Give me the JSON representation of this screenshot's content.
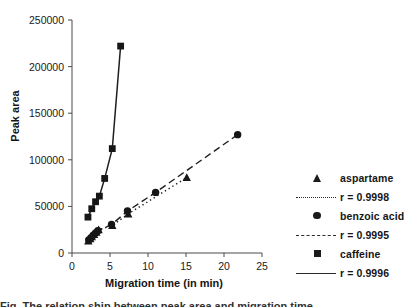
{
  "figure": {
    "caption_partial": "Fig. The relation ship between peak area and migration time",
    "background": "#ffffff",
    "ink": "#1b1b1b"
  },
  "axes": {
    "ylabel": "Peak area",
    "xlabel": "Migration time (in min)",
    "xticks": [
      "0",
      "5",
      "10",
      "15",
      "20",
      "25"
    ],
    "yticks": [
      "0",
      "50000",
      "100000",
      "150000",
      "200000",
      "250000"
    ]
  },
  "legend": {
    "rows": [
      {
        "kind": "series",
        "marker": "triangle-marker",
        "label": "aspartame"
      },
      {
        "kind": "fit",
        "marker": "dotted-line-key",
        "label": "r = 0.9998"
      },
      {
        "kind": "series",
        "marker": "circle-marker",
        "label": "benzoic acid"
      },
      {
        "kind": "fit",
        "marker": "dashed-line-key",
        "label": "r = 0.9995"
      },
      {
        "kind": "series",
        "marker": "square-marker",
        "label": "caffeine"
      },
      {
        "kind": "fit",
        "marker": "solid-line-key",
        "label": "r = 0.9996"
      }
    ]
  },
  "chart_data": {
    "type": "scatter",
    "title": "",
    "xlabel": "Migration time (in min)",
    "ylabel": "Peak area",
    "xlim": [
      0,
      25
    ],
    "ylim": [
      0,
      250000
    ],
    "grid": false,
    "legend_position": "right",
    "series": [
      {
        "name": "aspartame",
        "marker": "triangle",
        "fit_line": "dotted",
        "r": "0.9998",
        "points": [
          {
            "x": 2.15,
            "y": 13000
          },
          {
            "x": 2.4,
            "y": 15500
          },
          {
            "x": 2.6,
            "y": 17500
          },
          {
            "x": 2.9,
            "y": 20000
          },
          {
            "x": 3.2,
            "y": 22500
          },
          {
            "x": 3.5,
            "y": 25000
          },
          {
            "x": 5.3,
            "y": 29500
          },
          {
            "x": 7.4,
            "y": 42000
          },
          {
            "x": 15.1,
            "y": 81000
          }
        ]
      },
      {
        "name": "benzoic acid",
        "marker": "circle",
        "fit_line": "dashed",
        "r": "0.9995",
        "points": [
          {
            "x": 2.2,
            "y": 14000
          },
          {
            "x": 2.5,
            "y": 16500
          },
          {
            "x": 2.8,
            "y": 19000
          },
          {
            "x": 3.1,
            "y": 21500
          },
          {
            "x": 3.4,
            "y": 24000
          },
          {
            "x": 5.2,
            "y": 30500
          },
          {
            "x": 7.3,
            "y": 45000
          },
          {
            "x": 11.0,
            "y": 65000
          },
          {
            "x": 21.8,
            "y": 127000
          }
        ]
      },
      {
        "name": "caffeine",
        "marker": "square",
        "fit_line": "solid",
        "r": "0.9996",
        "points": [
          {
            "x": 2.1,
            "y": 38500
          },
          {
            "x": 2.6,
            "y": 47500
          },
          {
            "x": 3.1,
            "y": 55000
          },
          {
            "x": 3.6,
            "y": 61000
          },
          {
            "x": 4.3,
            "y": 80000
          },
          {
            "x": 5.3,
            "y": 112000
          },
          {
            "x": 6.4,
            "y": 222000
          }
        ]
      }
    ]
  }
}
